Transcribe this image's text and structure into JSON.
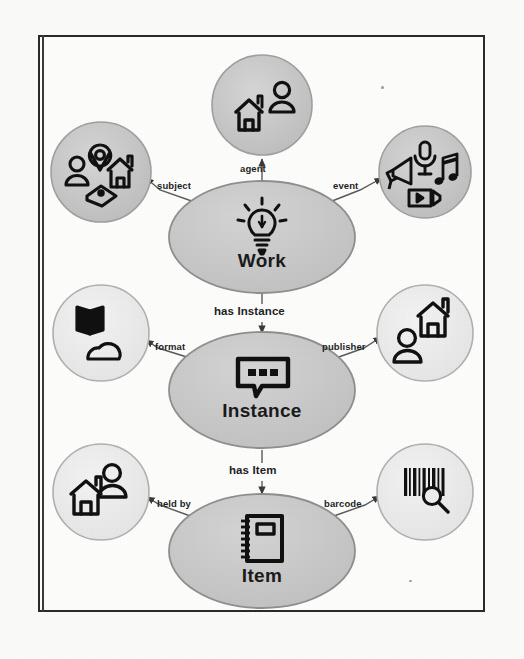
{
  "diagram": {
    "colors": {
      "main_fill": "#c9c9c9",
      "main_stroke": "#8f8f8f",
      "satellite_dark_fill": "#c4c4c4",
      "satellite_light_fill": "#ededed",
      "satellite_stroke": "#a6a6a6",
      "icon": "#101010",
      "text": "#1b1b1b",
      "page_border": "#2b2b2b",
      "background": "#fdfdfc"
    },
    "core_nodes": [
      {
        "id": "work",
        "label": "Work",
        "icon": "lightbulb-icon",
        "cx": 262,
        "cy": 237,
        "rx": 93,
        "ry": 56
      },
      {
        "id": "instance",
        "label": "Instance",
        "icon": "speech-bubble-icon",
        "cx": 262,
        "cy": 390,
        "rx": 93,
        "ry": 58
      },
      {
        "id": "item",
        "label": "Item",
        "icon": "notebook-icon",
        "cx": 262,
        "cy": 551,
        "rx": 93,
        "ry": 57
      }
    ],
    "satellites": [
      {
        "id": "agent",
        "relation": "agent",
        "cx": 262,
        "cy": 105,
        "r": 50,
        "tone": "dark",
        "icons": [
          "house-icon",
          "person-icon"
        ]
      },
      {
        "id": "subject",
        "relation": "subject",
        "cx": 101,
        "cy": 172,
        "r": 50,
        "tone": "dark",
        "icons": [
          "location-pin-icon",
          "person-icon",
          "house-icon",
          "tag-icon"
        ]
      },
      {
        "id": "event",
        "relation": "event",
        "cx": 425,
        "cy": 172,
        "r": 46,
        "tone": "dark",
        "icons": [
          "microphone-icon",
          "megaphone-icon",
          "music-note-icon",
          "video-icon"
        ]
      },
      {
        "id": "format",
        "relation": "format",
        "cx": 101,
        "cy": 333,
        "r": 48,
        "tone": "light",
        "icons": [
          "open-book-icon",
          "cloud-icon"
        ]
      },
      {
        "id": "publisher",
        "relation": "publisher",
        "cx": 425,
        "cy": 333,
        "r": 48,
        "tone": "light",
        "icons": [
          "house-icon",
          "person-icon"
        ]
      },
      {
        "id": "heldby",
        "relation": "held by",
        "cx": 101,
        "cy": 492,
        "r": 48,
        "tone": "light",
        "icons": [
          "house-icon",
          "person-icon"
        ]
      },
      {
        "id": "barcode",
        "relation": "barcode",
        "cx": 425,
        "cy": 492,
        "r": 48,
        "tone": "light",
        "icons": [
          "barcode-icon",
          "magnifier-icon"
        ]
      }
    ],
    "edges": [
      {
        "id": "work-agent",
        "label": "agent",
        "from": "work",
        "to": "agent",
        "label_x": 240,
        "label_y": 163
      },
      {
        "id": "work-subject",
        "label": "subject",
        "from": "work",
        "to": "subject",
        "label_x": 157,
        "label_y": 180
      },
      {
        "id": "work-event",
        "label": "event",
        "from": "work",
        "to": "event",
        "label_x": 333,
        "label_y": 180
      },
      {
        "id": "work-instance",
        "label": "has Instance",
        "from": "work",
        "to": "instance",
        "label_x": 216,
        "label_y": 312
      },
      {
        "id": "instance-format",
        "label": "format",
        "from": "instance",
        "to": "format",
        "label_x": 155,
        "label_y": 341
      },
      {
        "id": "instance-publisher",
        "label": "publisher",
        "from": "instance",
        "to": "publisher",
        "label_x": 324,
        "label_y": 341
      },
      {
        "id": "instance-item",
        "label": "has Item",
        "from": "instance",
        "to": "item",
        "label_x": 231,
        "label_y": 472
      },
      {
        "id": "item-heldby",
        "label": "held by",
        "from": "item",
        "to": "heldby",
        "label_x": 157,
        "label_y": 498
      },
      {
        "id": "item-barcode",
        "label": "barcode",
        "from": "item",
        "to": "barcode",
        "label_x": 325,
        "label_y": 498
      }
    ]
  }
}
